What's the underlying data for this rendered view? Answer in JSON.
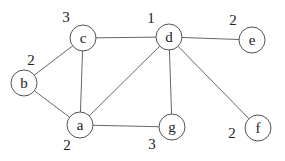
{
  "graph": {
    "nodes": [
      {
        "id": "a",
        "label": "a",
        "weight": "2",
        "x": 80,
        "y": 125,
        "lx": 67,
        "ly": 150
      },
      {
        "id": "b",
        "label": "b",
        "weight": "2",
        "x": 24,
        "y": 83,
        "lx": 31,
        "ly": 65
      },
      {
        "id": "c",
        "label": "c",
        "weight": "3",
        "x": 83,
        "y": 38,
        "lx": 66,
        "ly": 22
      },
      {
        "id": "d",
        "label": "d",
        "weight": "1",
        "x": 169,
        "y": 37,
        "lx": 151,
        "ly": 23
      },
      {
        "id": "e",
        "label": "e",
        "weight": "2",
        "x": 252,
        "y": 40,
        "lx": 233,
        "ly": 25
      },
      {
        "id": "f",
        "label": "f",
        "weight": "2",
        "x": 258,
        "y": 128,
        "lx": 232,
        "ly": 138
      },
      {
        "id": "g",
        "label": "g",
        "weight": "3",
        "x": 172,
        "y": 127,
        "lx": 152,
        "ly": 149
      }
    ],
    "edges": [
      [
        "b",
        "c"
      ],
      [
        "b",
        "a"
      ],
      [
        "c",
        "a"
      ],
      [
        "c",
        "d"
      ],
      [
        "a",
        "d"
      ],
      [
        "a",
        "g"
      ],
      [
        "d",
        "g"
      ],
      [
        "d",
        "e"
      ],
      [
        "d",
        "f"
      ]
    ]
  }
}
